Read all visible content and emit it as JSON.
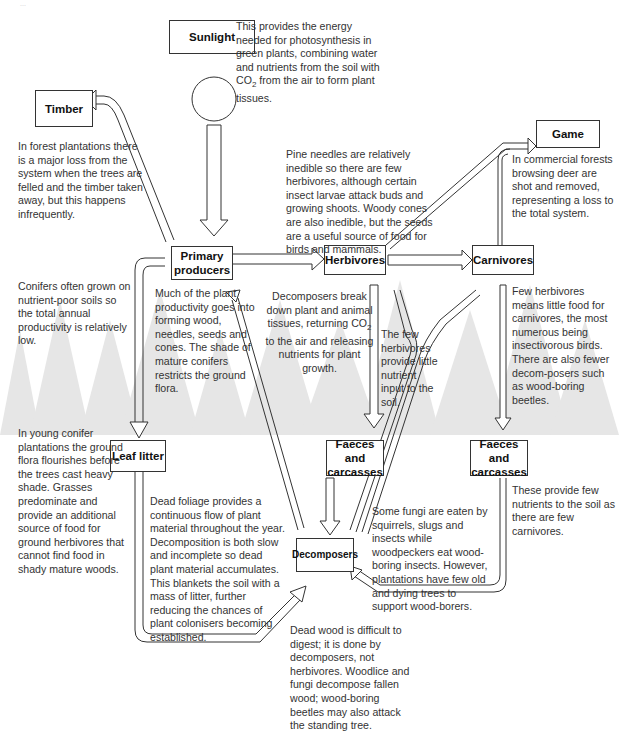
{
  "caption": "...",
  "nodes": {
    "sunlight": "Sunlight",
    "timber": "Timber",
    "game": "Game",
    "primary_producers": "Primary producers",
    "herbivores": "Herbivores",
    "carnivores": "Carnivores",
    "leaf_litter": "Leaf litter",
    "faeces_herb": "Faeces and carcasses",
    "faeces_carn": "Faeces and carcasses",
    "decomposers": "Decomposers"
  },
  "notes": {
    "sunlight_pre": "This provides the energy needed for photosynthesis in green plants, combining water and nutrients from the soil with CO",
    "sunlight_sub": "2",
    "sunlight_post": " from the air to form plant tissues.",
    "timber": "In forest plantations there is a major loss from the system when the trees are felled and the timber taken away, but this happens infrequently.",
    "herbivores": "Pine needles are relatively inedible so there are few herbivores, although certain insect larvae  attack buds and growing shoots. Woody cones are also inedible, but the seeds are a useful source of food for birds and mammals.",
    "game": "In commercial forests browsing deer are shot and removed, representing a loss to the total system.",
    "conifers": "Conifers often grown on nutrient-poor soils so the total annual productivity is relatively low.",
    "productivity": "Much of the plant productivity goes into forming wood, needles, seeds and cones. The shade of mature conifers restricts the ground flora.",
    "decomp_pre": "Decomposers break down plant and animal tissues, returning CO",
    "decomp_sub": "2",
    "decomp_post": " to the air and releasing nutrients for plant growth.",
    "few_herbivores": "The few herbivores provide little nutrient input to the soil.",
    "carnivores": "Few herbivores means little food for carnivores, the most numerous being insectivorous birds. There are also fewer decom-posers such as wood-boring beetles.",
    "young_conifer": "In young conifer plantations the ground flora flourishes before the trees cast heavy shade. Grasses predominate and provide an additional source of food for ground herbivores that cannot find food in shady mature woods.",
    "dead_foliage": "Dead foliage provides a continuous flow of plant material throughout the year. Decomposition is both slow and incomplete so dead plant material accumulates. This blankets the soil with a mass of litter, further reducing the chances of plant colonisers becoming established.",
    "fungi": "Some fungi are eaten by squirrels, slugs and insects while woodpeckers eat wood-boring insects. However, plantations have few old and dying trees to support wood-borers.",
    "few_carnivores": "These provide few nutrients to the soil as there are few carnivores.",
    "dead_wood": "Dead wood is difficult to digest; it is done by decomposers, not herbivores.  Woodlice and fungi decompose fallen wood; wood-boring beetles may also attack the standing tree."
  },
  "colors": {
    "tree_silhouette": "#e4e4e4",
    "line": "#333333"
  }
}
